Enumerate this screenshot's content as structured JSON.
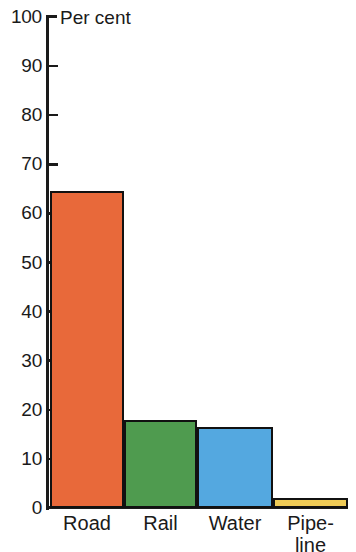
{
  "chart_data": {
    "type": "bar",
    "title": "",
    "axis_title": "Per cent",
    "xlabel": "",
    "ylabel": "Per cent",
    "ylim": [
      0,
      100
    ],
    "ytick_step": 10,
    "grid": false,
    "legend": "none",
    "categories": [
      "Road",
      "Rail",
      "Water",
      "Pipe-\nline"
    ],
    "category_plain": [
      "Road",
      "Rail",
      "Water",
      "Pipeline"
    ],
    "values": [
      64.5,
      18,
      16.5,
      2
    ],
    "yticks": [
      "0",
      "10",
      "20",
      "30",
      "40",
      "50",
      "60",
      "70",
      "80",
      "90",
      "100"
    ],
    "colors": [
      "#E8693A",
      "#4F9B4F",
      "#54A8E0",
      "#EFCB56"
    ],
    "bar_outline_color": "#111111",
    "axis_color": "#1a1a1a",
    "background": "#ffffff"
  }
}
